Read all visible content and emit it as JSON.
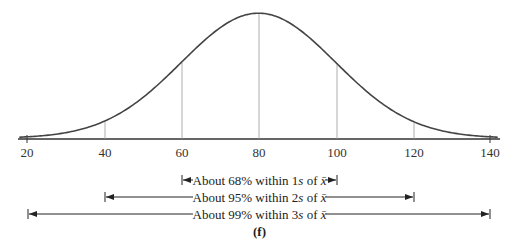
{
  "chart_data": {
    "type": "line",
    "title": "",
    "subtitle": "(f)",
    "mean": 80,
    "std": 20,
    "xlabel": "",
    "ylabel": "",
    "xlim": [
      18,
      142
    ],
    "x_ticks": [
      20,
      40,
      60,
      80,
      100,
      120,
      140
    ],
    "x_tick_labels": [
      "20",
      "40",
      "60",
      "80",
      "100",
      "120",
      "140"
    ],
    "vertical_lines_at": [
      40,
      60,
      80,
      100,
      120
    ],
    "grid": false,
    "annotations": [
      {
        "text": "About 68% within 1s of x̄",
        "from": 60,
        "to": 100
      },
      {
        "text": "About 95% within 2s of x̄",
        "from": 40,
        "to": 120
      },
      {
        "text": "About 99% within 3s of x̄",
        "from": 20,
        "to": 140
      }
    ]
  },
  "labels": {
    "ticks": [
      "20",
      "40",
      "60",
      "80",
      "100",
      "120",
      "140"
    ],
    "range1": {
      "pre": "About 68% within 1",
      "s": "s",
      "mid": " of ",
      "xbar": "x̄"
    },
    "range2": {
      "pre": "About 95% within 2",
      "s": "s",
      "mid": " of ",
      "xbar": "x̄"
    },
    "range3": {
      "pre": "About 99% within 3",
      "s": "s",
      "mid": " of ",
      "xbar": "x̄"
    },
    "caption": "(f)"
  }
}
